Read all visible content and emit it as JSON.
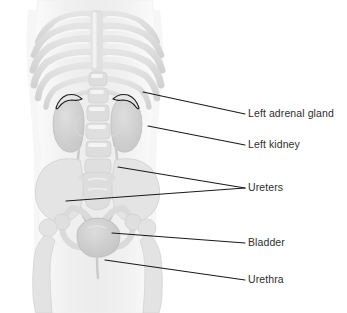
{
  "figure": {
    "background_color": "#ffffff",
    "width": 347,
    "height": 313
  },
  "colors": {
    "background": "#ffffff",
    "body_silhouette": "#f4f4f4",
    "bone_light": "#e9e9e9",
    "bone_mid": "#dcdcdc",
    "bone_shade": "#cfcfcf",
    "organ_fill": "#d8d8d8",
    "organ_shade": "#c8c8c8",
    "adrenal_outline": "#1a1a1a",
    "leader_line": "#1a1a1a",
    "label_text": "#2e2e2e"
  },
  "labels": [
    {
      "id": "left-adrenal-gland",
      "text": "Left adrenal gland",
      "text_x": 248,
      "text_y": 114,
      "leader": {
        "x1": 143,
        "y1": 92,
        "x2": 245,
        "y2": 114
      }
    },
    {
      "id": "left-kidney",
      "text": "Left kidney",
      "text_x": 248,
      "text_y": 145,
      "leader": {
        "x1": 148,
        "y1": 126,
        "x2": 245,
        "y2": 145
      }
    },
    {
      "id": "ureters",
      "text": "Ureters",
      "text_x": 248,
      "text_y": 188,
      "leader": {
        "x1": 118,
        "y1": 167,
        "x2": 245,
        "y2": 188
      },
      "leader2": {
        "x1": 66,
        "y1": 201,
        "x2": 245,
        "y2": 188
      }
    },
    {
      "id": "bladder",
      "text": "Bladder",
      "text_x": 248,
      "text_y": 243,
      "leader": {
        "x1": 112,
        "y1": 233,
        "x2": 245,
        "y2": 243
      }
    },
    {
      "id": "urethra",
      "text": "Urethra",
      "text_x": 248,
      "text_y": 280,
      "leader": {
        "x1": 105,
        "y1": 260,
        "x2": 245,
        "y2": 280
      }
    }
  ],
  "anatomy_parts": [
    {
      "id": "body-silhouette",
      "name": "torso-silhouette"
    },
    {
      "id": "rib-cage",
      "name": "rib-cage"
    },
    {
      "id": "sternum",
      "name": "sternum"
    },
    {
      "id": "spine",
      "name": "lumbar-spine"
    },
    {
      "id": "left-kidney-shape",
      "name": "left-kidney"
    },
    {
      "id": "right-kidney-shape",
      "name": "right-kidney"
    },
    {
      "id": "left-adrenal-shape",
      "name": "left-adrenal-gland"
    },
    {
      "id": "right-adrenal-shape",
      "name": "right-adrenal-gland"
    },
    {
      "id": "ureter-left",
      "name": "left-ureter"
    },
    {
      "id": "ureter-right",
      "name": "right-ureter"
    },
    {
      "id": "pelvis",
      "name": "pelvis"
    },
    {
      "id": "sacrum",
      "name": "sacrum"
    },
    {
      "id": "bladder-shape",
      "name": "bladder"
    },
    {
      "id": "urethra-shape",
      "name": "urethra"
    },
    {
      "id": "femur-left",
      "name": "left-femur"
    },
    {
      "id": "femur-right",
      "name": "right-femur"
    }
  ]
}
